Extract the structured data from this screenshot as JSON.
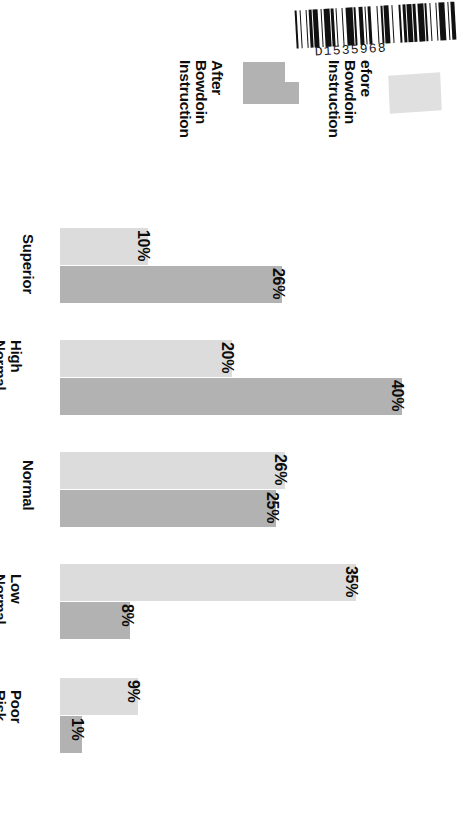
{
  "document": {
    "barcode": {
      "icon": "barcode-icon",
      "number": "D1535968",
      "pattern": "1,2,1,3,1,1,2,1,3,2,1,1,4,1,2,1,1,3,1,2,4,1,1,2,3,1,1,1,2,4,1,2,1,1,3,2,1,4,1,1,2,1,3,1,2,1,4,1,1,2,1,3,1,1,4,2,1,1,3,1"
    }
  },
  "legend": {
    "position": "top",
    "entries": [
      {
        "label": "After Bowdoin\nInstruction",
        "color": "#b2b2b2",
        "key": "after"
      },
      {
        "label": "efore Bowdoin\nInstruction",
        "color": "#e0e0e0",
        "key": "before"
      }
    ]
  },
  "chart_data": {
    "type": "bar",
    "orientation": "horizontal",
    "title": "",
    "subtitle": "",
    "xlabel": "",
    "ylabel": "",
    "grid": false,
    "legend_position": "top",
    "xlim": [
      0,
      40
    ],
    "value_suffix": "%",
    "categories": [
      "Superior",
      "High\nNormal",
      "Normal",
      "Low\nNormal",
      "Poor\nRisk"
    ],
    "series": [
      {
        "name": "efore Bowdoin Instruction",
        "color": "#dcdcdc",
        "values": [
          10,
          20,
          26,
          35,
          9
        ],
        "labels": [
          "10%",
          "20%",
          "26%",
          "35%",
          "9%"
        ]
      },
      {
        "name": "After Bowdoin Instruction",
        "color": "#b2b2b2",
        "values": [
          26,
          40,
          25,
          8,
          1
        ],
        "labels": [
          "26%",
          "40%",
          "25%",
          "8%",
          "1%"
        ]
      }
    ]
  },
  "layout": {
    "groups": [
      {
        "top": 16,
        "label_left": 36,
        "label_top": 22,
        "before_width": 88,
        "after_width": 222,
        "before_value_left": 152,
        "after_value_left": 287
      },
      {
        "top": 128,
        "label_left": 24,
        "label_top": 128,
        "before_width": 172,
        "after_width": 342,
        "before_value_left": 236,
        "after_value_left": 406
      },
      {
        "top": 240,
        "label_left": 36,
        "label_top": 248,
        "before_width": 225,
        "after_width": 216,
        "before_value_left": 289,
        "after_value_left": 281
      },
      {
        "top": 352,
        "label_left": 24,
        "label_top": 362,
        "before_width": 296,
        "after_width": 70,
        "before_value_left": 360,
        "after_value_left": 136
      },
      {
        "top": 466,
        "label_left": 24,
        "label_top": 478,
        "before_width": 78,
        "after_width": 22,
        "before_value_left": 142,
        "after_value_left": 86
      }
    ]
  }
}
